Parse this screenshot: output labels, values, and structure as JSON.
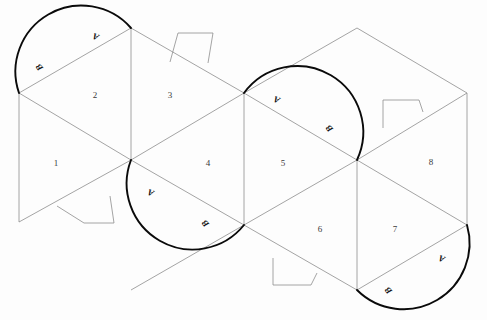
{
  "diagram": {
    "background_color": "#fdfdfd",
    "fold_line_color": "#8d8d8d",
    "arc_color": "#0a0a0a",
    "label_color": "#3a3a3a",
    "width": 487,
    "height": 320,
    "face_labels": [
      {
        "text": "1",
        "x": 56,
        "y": 164
      },
      {
        "text": "2",
        "x": 95,
        "y": 96
      },
      {
        "text": "3",
        "x": 170,
        "y": 96
      },
      {
        "text": "4",
        "x": 208,
        "y": 164
      },
      {
        "text": "5",
        "x": 283,
        "y": 164
      },
      {
        "text": "6",
        "x": 320,
        "y": 230
      },
      {
        "text": "7",
        "x": 395,
        "y": 230
      },
      {
        "text": "8",
        "x": 431,
        "y": 163
      }
    ],
    "arc_labels": [
      {
        "text": "A",
        "x": 96,
        "y": 36,
        "rotation": 200
      },
      {
        "text": "B",
        "x": 40,
        "y": 67,
        "rotation": 232
      },
      {
        "text": "A",
        "x": 277,
        "y": 99,
        "rotation": 200
      },
      {
        "text": "B",
        "x": 330,
        "y": 128,
        "rotation": 230
      },
      {
        "text": "A",
        "x": 151,
        "y": 192,
        "rotation": 200
      },
      {
        "text": "B",
        "x": 206,
        "y": 223,
        "rotation": 230
      },
      {
        "text": "A",
        "x": 442,
        "y": 258,
        "rotation": 200
      },
      {
        "text": "B",
        "x": 389,
        "y": 290,
        "rotation": 230
      }
    ],
    "arcs": [
      {
        "name": "arc-top-left",
        "start_x": 19,
        "start_y": 93,
        "end_x": 131,
        "end_y": 28
      },
      {
        "name": "arc-middle-left",
        "start_x": 131,
        "start_y": 160,
        "end_x": 244,
        "end_y": 225
      },
      {
        "name": "arc-top-right",
        "start_x": 244,
        "start_y": 93,
        "end_x": 357,
        "end_y": 160
      },
      {
        "name": "arc-bottom-right",
        "start_x": 357,
        "start_y": 290,
        "end_x": 467,
        "end_y": 225
      }
    ],
    "tabs": [
      {
        "name": "tab-top-middle",
        "x": 170,
        "y": 30
      },
      {
        "name": "tab-top-right",
        "x": 383,
        "y": 96
      },
      {
        "name": "tab-bottom-left",
        "x": 57,
        "y": 196
      },
      {
        "name": "tab-bottom-middle",
        "x": 270,
        "y": 262
      }
    ]
  }
}
